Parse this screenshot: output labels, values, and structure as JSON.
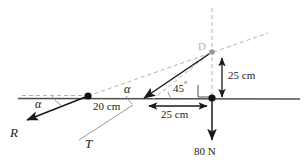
{
  "figure": {
    "type": "free-body-diagram",
    "title": "",
    "canvas": {
      "width": 308,
      "height": 167
    },
    "background_color": "#ffffff"
  },
  "colors": {
    "solid_line": "#4d4d4d",
    "force_line": "#1a1a1a",
    "dashed_line": "#b2b2b2",
    "node_dark": "#111111",
    "node_light": "#999999",
    "text": "#1a1a1a",
    "text_faint": "#b2b2b2"
  },
  "labels": {
    "reaction_force": "R",
    "tension_force": "T",
    "load_force": "80 N",
    "angle_left": "α",
    "angle_mid": "α",
    "angle_45": "45",
    "degree_symbol": "°",
    "point_d": "D",
    "dim_20": "20 cm",
    "dim_25_horizontal": "25 cm",
    "dim_25_vertical": "25 cm"
  },
  "geometry": {
    "beam_y": 98,
    "hinge_node": {
      "x": 88,
      "y": 96
    },
    "wall_node": {
      "x": 212,
      "y": 98
    },
    "apex_node": {
      "x": 212,
      "y": 52
    },
    "beam_left_end": {
      "x": 18,
      "y": 97
    },
    "beam_right_end": {
      "x": 300,
      "y": 99
    }
  },
  "measurements": {
    "span_20_cm": 20,
    "span_25_cm_horizontal": 25,
    "rise_25_cm_vertical": 25,
    "angle_at_support_deg": 45,
    "load_newtons": 80,
    "units_length": "cm",
    "units_force": "N"
  },
  "elements": {
    "reaction_arrow": {
      "from": {
        "x": 88,
        "y": 96
      },
      "to": {
        "x": 24,
        "y": 122
      },
      "style": "solid-arrow"
    },
    "tension_arrow": {
      "from": {
        "x": 212,
        "y": 52
      },
      "to": {
        "x": 141,
        "y": 100
      },
      "style": "solid-arrow"
    },
    "load_arrow": {
      "from": {
        "x": 212,
        "y": 98
      },
      "to": {
        "x": 212,
        "y": 143
      },
      "style": "solid-arrow"
    },
    "vertical_dim_arrow": {
      "from": {
        "x": 222,
        "y": 98
      },
      "to": {
        "x": 222,
        "y": 56
      },
      "style": "double-arrow"
    },
    "horizontal_dim_arrow": {
      "from": {
        "x": 147,
        "y": 106
      },
      "to": {
        "x": 209,
        "y": 106
      },
      "style": "double-arrow"
    },
    "right_angle_marker": {
      "x": 198,
      "y": 84,
      "size": 12
    }
  }
}
